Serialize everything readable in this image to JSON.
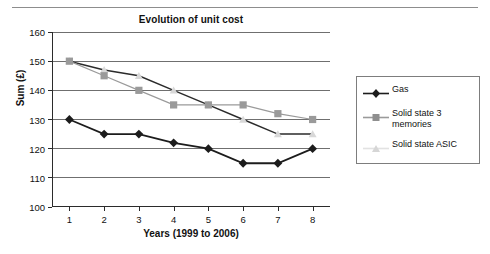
{
  "chart_data": {
    "type": "line",
    "title": "Evolution of unit cost",
    "xlabel": "Years (1999 to 2006)",
    "ylabel": "Sum (£)",
    "x": [
      1,
      2,
      3,
      4,
      5,
      6,
      7,
      8
    ],
    "categories": [
      "1",
      "2",
      "3",
      "4",
      "5",
      "6",
      "7",
      "8"
    ],
    "xlim": [
      0.5,
      8.5
    ],
    "ylim": [
      100,
      160
    ],
    "yticks": [
      100,
      110,
      120,
      130,
      140,
      150,
      160
    ],
    "ytick_labels": [
      "100",
      "110",
      "120",
      "130",
      "140",
      "150",
      "160"
    ],
    "grid": "horizontal",
    "legend_position": "right-outside",
    "series": [
      {
        "name": "Gas",
        "marker": "diamond",
        "color": "#1c1c1c",
        "values": [
          130,
          125,
          125,
          122,
          120,
          115,
          115,
          120
        ]
      },
      {
        "name": "Solid state 3 memories",
        "marker": "square",
        "color": "#9a9a9a",
        "values": [
          150,
          145,
          140,
          135,
          135,
          135,
          132,
          130
        ]
      },
      {
        "name": "Solid state ASIC",
        "marker": "triangle",
        "color": "#d8d8d8",
        "line_color": "#2b2b2b",
        "values": [
          150,
          147,
          145,
          140,
          135,
          130,
          125,
          125
        ]
      }
    ]
  },
  "legend": {
    "entries": [
      {
        "label": "Gas"
      },
      {
        "label": "Solid state 3 memories"
      },
      {
        "label": "Solid state ASIC"
      }
    ]
  }
}
